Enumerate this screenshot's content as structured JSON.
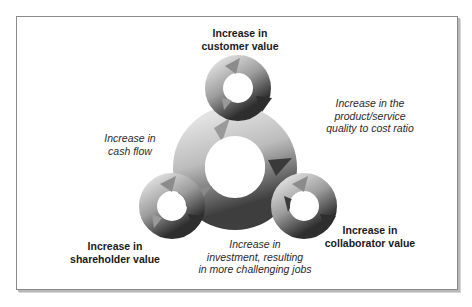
{
  "diagram": {
    "nodes": {
      "customer": {
        "lines": [
          "Increase in",
          "customer value"
        ]
      },
      "shareholder": {
        "lines": [
          "Increase in",
          "shareholder value"
        ]
      },
      "collaborator": {
        "lines": [
          "Increase in",
          "collaborator value"
        ]
      }
    },
    "edges": {
      "quality": {
        "lines": [
          "Increase in the",
          "product/service",
          "quality to cost ratio"
        ]
      },
      "cash_flow": {
        "lines": [
          "Increase in",
          "cash flow"
        ]
      },
      "investment": {
        "lines": [
          "Increase in",
          "investment, resulting",
          "in more challenging jobs"
        ]
      }
    },
    "colors": {
      "arrow_light": "#d8d8d8",
      "arrow_mid": "#9a9a9a",
      "arrow_dark": "#3a3a3a",
      "frame": "#8a8a8a"
    }
  }
}
